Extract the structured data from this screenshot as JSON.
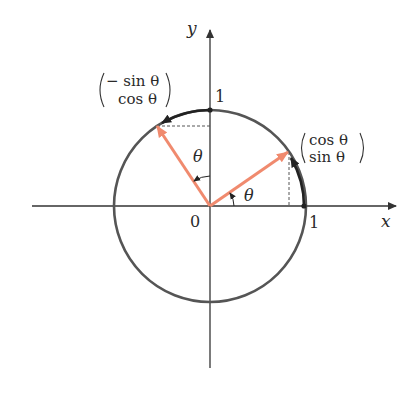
{
  "diagram": {
    "axes": {
      "x_label": "x",
      "y_label": "y",
      "origin_label": "0",
      "x_tick_label": "1",
      "y_tick_label": "1"
    },
    "angle_labels": {
      "theta_right": "θ",
      "theta_left": "θ"
    },
    "vectors": [
      {
        "name": "rotated-e1",
        "top": "cos θ",
        "bottom": "sin θ"
      },
      {
        "name": "rotated-e2",
        "top": "− sin θ",
        "bottom": "cos θ"
      }
    ],
    "colors": {
      "vector": "#f08a6e",
      "circle": "#555555",
      "axis": "#333333",
      "arc": "#222222"
    }
  }
}
